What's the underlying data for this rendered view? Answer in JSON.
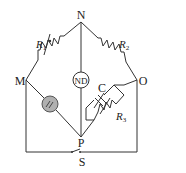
{
  "diagram": {
    "type": "bridge-circuit",
    "nodes": {
      "top": "N",
      "left": "M",
      "right": "O",
      "bottom": "P"
    },
    "components": {
      "r1": {
        "label": "R",
        "sub": "1",
        "kind": "variable-resistor"
      },
      "r2": {
        "label": "R",
        "sub": "2",
        "kind": "resistor"
      },
      "r3": {
        "label": "R",
        "sub": "3",
        "kind": "variable-resistor"
      },
      "c": {
        "label": "C",
        "kind": "variable-capacitor"
      },
      "detector": {
        "label": "ND",
        "kind": "null-detector"
      },
      "source": {
        "kind": "ac-source",
        "fill": "#b0b0b0"
      },
      "switch": {
        "label": "S",
        "kind": "switch"
      }
    },
    "colors": {
      "wire": "#333333",
      "source_fill": "#b0b0b0",
      "background": "#ffffff"
    }
  }
}
